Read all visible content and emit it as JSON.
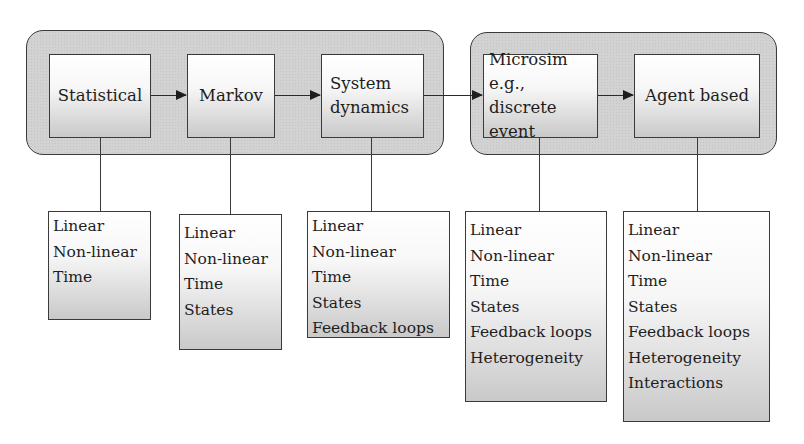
{
  "diagram": {
    "groups": [
      {
        "id": "analytic-models",
        "members": [
          "Statistical",
          "Markov",
          "System dynamics"
        ]
      },
      {
        "id": "simulation-models",
        "members": [
          "Microsim e.g., discrete event",
          "Agent based"
        ]
      }
    ],
    "models": [
      {
        "label": "Statistical",
        "attributes": [
          "Linear",
          "Non-linear",
          "Time"
        ]
      },
      {
        "label": "Markov",
        "attributes": [
          "Linear",
          "Non-linear",
          "Time",
          "States"
        ]
      },
      {
        "label": "System\ndynamics",
        "attributes": [
          "Linear",
          "Non-linear",
          "Time",
          "States",
          "Feedback loops"
        ]
      },
      {
        "label": "Microsim\ne.g., discrete\nevent",
        "attributes": [
          "Linear",
          "Non-linear",
          "Time",
          "States",
          "Feedback loops",
          "Heterogeneity"
        ]
      },
      {
        "label": "Agent based",
        "attributes": [
          "Linear",
          "Non-linear",
          "Time",
          "States",
          "Feedback loops",
          "Heterogeneity",
          "Interactions"
        ]
      }
    ],
    "flow": [
      "Statistical",
      "Markov",
      "System dynamics",
      "Microsim",
      "Agent based"
    ],
    "colors": {
      "group_fill": "#d2d2d2",
      "stroke": "#3a3a3a",
      "text": "#1e1e1e"
    }
  }
}
